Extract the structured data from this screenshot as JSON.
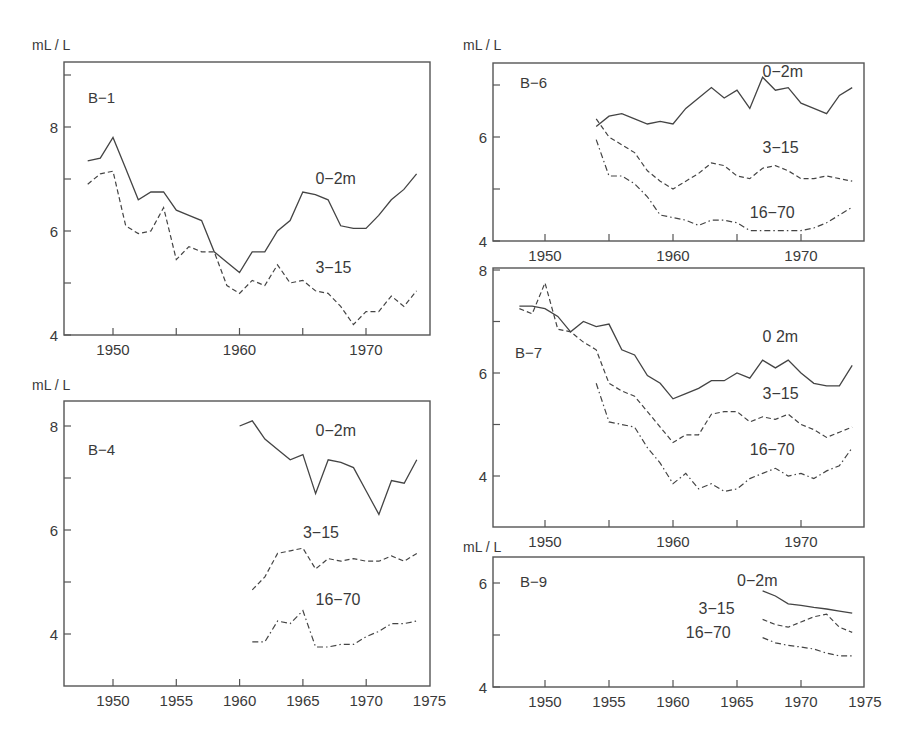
{
  "figure": {
    "unit_label": "mL / L"
  },
  "chart_data": [
    {
      "type": "line",
      "panel": "B-1",
      "ylabel": "mL / L",
      "xlim": [
        1946,
        1975
      ],
      "ylim": [
        4,
        9
      ],
      "x_ticks": [
        1950,
        1955,
        1960,
        1965,
        1970
      ],
      "x_tick_labels": [
        "1950",
        "",
        "1960",
        "",
        "1970"
      ],
      "y_ticks": [
        4,
        5,
        6,
        7,
        8,
        9
      ],
      "y_tick_labels": [
        "4",
        "",
        "6",
        "",
        "8",
        ""
      ],
      "grid": false,
      "series": [
        {
          "name": "0-2m",
          "style": "solid",
          "x": [
            1948,
            1949,
            1950,
            1951,
            1952,
            1953,
            1954,
            1955,
            1956,
            1957,
            1958,
            1959,
            1960,
            1961,
            1962,
            1963,
            1964,
            1965,
            1966,
            1967,
            1968,
            1969,
            1970,
            1971,
            1972,
            1973,
            1974
          ],
          "values": [
            7.35,
            7.4,
            7.8,
            7.2,
            6.6,
            6.75,
            6.75,
            6.4,
            6.3,
            6.2,
            5.6,
            5.4,
            5.2,
            5.6,
            5.6,
            6.0,
            6.2,
            6.75,
            6.7,
            6.6,
            6.1,
            6.05,
            6.05,
            6.3,
            6.6,
            6.8,
            7.1
          ]
        },
        {
          "name": "3-15",
          "style": "dashed",
          "x": [
            1948,
            1949,
            1950,
            1951,
            1952,
            1953,
            1954,
            1955,
            1956,
            1957,
            1958,
            1959,
            1960,
            1961,
            1962,
            1963,
            1964,
            1965,
            1966,
            1967,
            1968,
            1969,
            1970,
            1971,
            1972,
            1973,
            1974
          ],
          "values": [
            6.9,
            7.1,
            7.15,
            6.1,
            5.95,
            6.0,
            6.45,
            5.45,
            5.7,
            5.6,
            5.6,
            4.95,
            4.8,
            5.05,
            4.95,
            5.35,
            5.0,
            5.05,
            4.85,
            4.8,
            4.55,
            4.2,
            4.45,
            4.45,
            4.75,
            4.55,
            4.85
          ]
        }
      ],
      "annotations": [
        {
          "text": "0-2m",
          "x": 1966,
          "y": 6.9
        },
        {
          "text": "3-15",
          "x": 1966,
          "y": 5.2
        }
      ]
    },
    {
      "type": "line",
      "panel": "B-4",
      "ylabel": "mL / L",
      "xlim": [
        1946,
        1975
      ],
      "ylim": [
        3,
        8.5
      ],
      "x_ticks": [
        1950,
        1955,
        1960,
        1965,
        1970,
        1975
      ],
      "x_tick_labels": [
        "1950",
        "1955",
        "1960",
        "1965",
        "1970",
        "1975"
      ],
      "y_ticks": [
        4,
        5,
        6,
        7,
        8
      ],
      "y_tick_labels": [
        "4",
        "",
        "6",
        "",
        "8"
      ],
      "grid": false,
      "series": [
        {
          "name": "0-2m",
          "style": "solid",
          "x": [
            1960,
            1961,
            1962,
            1963,
            1964,
            1965,
            1966,
            1967,
            1968,
            1969,
            1970,
            1971,
            1972,
            1973,
            1974
          ],
          "values": [
            8.0,
            8.1,
            7.75,
            7.55,
            7.35,
            7.45,
            6.7,
            7.35,
            7.3,
            7.2,
            6.75,
            6.3,
            6.95,
            6.9,
            7.35
          ]
        },
        {
          "name": "3-15",
          "style": "dashed",
          "x": [
            1961,
            1962,
            1963,
            1964,
            1965,
            1966,
            1967,
            1968,
            1969,
            1970,
            1971,
            1972,
            1973,
            1974
          ],
          "values": [
            4.85,
            5.1,
            5.55,
            5.6,
            5.65,
            5.25,
            5.45,
            5.4,
            5.45,
            5.4,
            5.4,
            5.5,
            5.4,
            5.55
          ]
        },
        {
          "name": "16-70",
          "style": "dashdot",
          "x": [
            1961,
            1962,
            1963,
            1964,
            1965,
            1966,
            1967,
            1968,
            1969,
            1970,
            1971,
            1972,
            1973,
            1974
          ],
          "values": [
            3.85,
            3.85,
            4.25,
            4.2,
            4.45,
            3.75,
            3.75,
            3.8,
            3.8,
            3.95,
            4.05,
            4.2,
            4.2,
            4.25
          ]
        }
      ],
      "annotations": [
        {
          "text": "0-2m",
          "x": 1966,
          "y": 7.8
        },
        {
          "text": "3-15",
          "x": 1965,
          "y": 5.85
        },
        {
          "text": "16-70",
          "x": 1966,
          "y": 4.55
        }
      ]
    },
    {
      "type": "line",
      "panel": "B-6",
      "ylabel": "mL / L",
      "xlim": [
        1946,
        1975
      ],
      "ylim": [
        4,
        7.4
      ],
      "x_ticks": [
        1950,
        1955,
        1960,
        1965,
        1970
      ],
      "x_tick_labels": [
        "1950",
        "",
        "1960",
        "",
        "1970"
      ],
      "y_ticks": [
        4,
        5,
        6,
        7
      ],
      "y_tick_labels": [
        "4",
        "",
        "6",
        ""
      ],
      "grid": false,
      "series": [
        {
          "name": "0-2m",
          "style": "solid",
          "x": [
            1954,
            1955,
            1956,
            1957,
            1958,
            1959,
            1960,
            1961,
            1962,
            1963,
            1964,
            1965,
            1966,
            1967,
            1968,
            1969,
            1970,
            1971,
            1972,
            1973,
            1974
          ],
          "values": [
            6.2,
            6.4,
            6.45,
            6.35,
            6.25,
            6.3,
            6.25,
            6.55,
            6.75,
            6.95,
            6.75,
            6.9,
            6.55,
            7.15,
            6.9,
            6.95,
            6.65,
            6.55,
            6.45,
            6.8,
            6.95
          ]
        },
        {
          "name": "3-15",
          "style": "dashed",
          "x": [
            1954,
            1955,
            1956,
            1957,
            1958,
            1959,
            1960,
            1961,
            1962,
            1963,
            1964,
            1965,
            1966,
            1967,
            1968,
            1969,
            1970,
            1971,
            1972,
            1973,
            1974
          ],
          "values": [
            6.35,
            6.0,
            5.85,
            5.7,
            5.35,
            5.15,
            5.0,
            5.15,
            5.3,
            5.5,
            5.45,
            5.25,
            5.2,
            5.4,
            5.45,
            5.35,
            5.2,
            5.2,
            5.25,
            5.2,
            5.15
          ]
        },
        {
          "name": "16-70",
          "style": "dashdot",
          "x": [
            1954,
            1955,
            1956,
            1957,
            1958,
            1959,
            1960,
            1961,
            1962,
            1963,
            1964,
            1965,
            1966,
            1967,
            1968,
            1969,
            1970,
            1971,
            1972,
            1973,
            1974
          ],
          "values": [
            5.95,
            5.25,
            5.25,
            5.1,
            4.85,
            4.5,
            4.45,
            4.4,
            4.3,
            4.4,
            4.4,
            4.35,
            4.2,
            4.2,
            4.2,
            4.2,
            4.2,
            4.25,
            4.35,
            4.5,
            4.65
          ]
        }
      ],
      "annotations": [
        {
          "text": "0-2m",
          "x": 1967,
          "y": 7.15
        },
        {
          "text": "3-15",
          "x": 1967,
          "y": 5.7
        },
        {
          "text": "16-70",
          "x": 1966,
          "y": 4.45
        }
      ]
    },
    {
      "type": "line",
      "panel": "B-7",
      "ylabel": "",
      "xlim": [
        1946,
        1975
      ],
      "ylim": [
        3,
        8
      ],
      "x_ticks": [
        1950,
        1955,
        1960,
        1965,
        1970
      ],
      "x_tick_labels": [
        "1950",
        "",
        "1960",
        "",
        "1970"
      ],
      "y_ticks": [
        4,
        5,
        6,
        7,
        8
      ],
      "y_tick_labels": [
        "4",
        "",
        "6",
        "",
        "8"
      ],
      "grid": false,
      "series": [
        {
          "name": "0-2m",
          "style": "solid",
          "x": [
            1948,
            1949,
            1950,
            1951,
            1952,
            1953,
            1954,
            1955,
            1956,
            1957,
            1958,
            1959,
            1960,
            1961,
            1962,
            1963,
            1964,
            1965,
            1966,
            1967,
            1968,
            1969,
            1970,
            1971,
            1972,
            1973,
            1974
          ],
          "values": [
            7.3,
            7.3,
            7.25,
            7.1,
            6.8,
            7.0,
            6.9,
            6.95,
            6.45,
            6.35,
            5.95,
            5.8,
            5.5,
            5.6,
            5.7,
            5.85,
            5.85,
            6.0,
            5.9,
            6.25,
            6.1,
            6.25,
            6.0,
            5.8,
            5.75,
            5.75,
            6.15
          ]
        },
        {
          "name": "3-15",
          "style": "dashed",
          "x": [
            1948,
            1949,
            1950,
            1951,
            1952,
            1953,
            1954,
            1955,
            1956,
            1957,
            1958,
            1959,
            1960,
            1961,
            1962,
            1963,
            1964,
            1965,
            1966,
            1967,
            1968,
            1969,
            1970,
            1971,
            1972,
            1973,
            1974
          ],
          "values": [
            7.25,
            7.15,
            7.75,
            6.85,
            6.8,
            6.6,
            6.45,
            5.8,
            5.65,
            5.55,
            5.25,
            4.95,
            4.65,
            4.8,
            4.8,
            5.2,
            5.25,
            5.25,
            5.05,
            5.15,
            5.1,
            5.2,
            5.0,
            4.9,
            4.75,
            4.85,
            4.95
          ]
        },
        {
          "name": "16-70",
          "style": "dashdot",
          "x": [
            1954,
            1955,
            1956,
            1957,
            1958,
            1959,
            1960,
            1961,
            1962,
            1963,
            1964,
            1965,
            1966,
            1967,
            1968,
            1969,
            1970,
            1971,
            1972,
            1973,
            1974
          ],
          "values": [
            5.8,
            5.05,
            5.0,
            4.95,
            4.55,
            4.25,
            3.85,
            4.05,
            3.75,
            3.85,
            3.7,
            3.75,
            3.95,
            4.05,
            4.15,
            4.0,
            4.05,
            3.95,
            4.1,
            4.2,
            4.55
          ]
        }
      ],
      "annotations": [
        {
          "text": "0 2m",
          "x": 1967,
          "y": 6.6
        },
        {
          "text": "3-15",
          "x": 1967,
          "y": 5.5
        },
        {
          "text": "16-70",
          "x": 1966,
          "y": 4.4
        }
      ]
    },
    {
      "type": "line",
      "panel": "B-9",
      "ylabel": "mL / L",
      "xlim": [
        1946,
        1975
      ],
      "ylim": [
        4,
        6.5
      ],
      "x_ticks": [
        1950,
        1955,
        1960,
        1965,
        1970,
        1975
      ],
      "x_tick_labels": [
        "1950",
        "1955",
        "1960",
        "1965",
        "1970",
        "1975"
      ],
      "y_ticks": [
        4,
        5,
        6
      ],
      "y_tick_labels": [
        "4",
        "",
        "6"
      ],
      "grid": false,
      "series": [
        {
          "name": "0-2m",
          "style": "solid",
          "x": [
            1967,
            1968,
            1969,
            1970,
            1971,
            1972,
            1973,
            1974
          ],
          "values": [
            5.85,
            5.75,
            5.6,
            5.57,
            5.53,
            5.5,
            5.46,
            5.42
          ]
        },
        {
          "name": "3-15",
          "style": "dashed",
          "x": [
            1967,
            1968,
            1969,
            1970,
            1971,
            1972,
            1973,
            1974
          ],
          "values": [
            5.3,
            5.2,
            5.15,
            5.25,
            5.35,
            5.4,
            5.15,
            5.05
          ]
        },
        {
          "name": "16-70",
          "style": "dashdot",
          "x": [
            1967,
            1968,
            1969,
            1970,
            1971,
            1972,
            1973,
            1974
          ],
          "values": [
            4.95,
            4.85,
            4.8,
            4.77,
            4.73,
            4.65,
            4.6,
            4.6
          ]
        }
      ],
      "annotations": [
        {
          "text": "0-2m",
          "x": 1965,
          "y": 5.95
        },
        {
          "text": "3-15",
          "x": 1962,
          "y": 5.4
        },
        {
          "text": "16-70",
          "x": 1961,
          "y": 4.95
        }
      ]
    }
  ]
}
